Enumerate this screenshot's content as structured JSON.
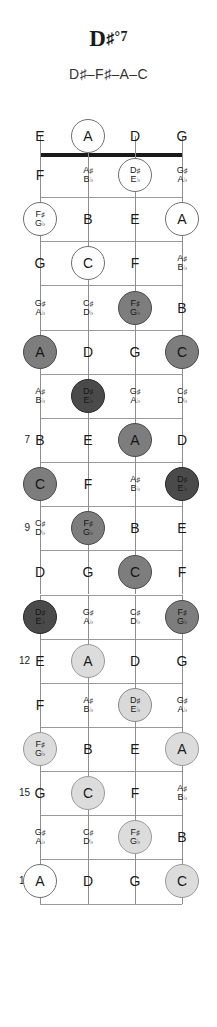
{
  "header": {
    "chord_name": "D#°7",
    "chord_root": "D",
    "chord_accidental": "♯",
    "chord_quality": "°7",
    "chord_notes": "D♯–F♯–A–C"
  },
  "diagram": {
    "type": "bass-fretboard",
    "instrument": "bass-guitar",
    "string_count": 4,
    "strings_open": [
      "E",
      "A",
      "D",
      "G"
    ],
    "fret_start": 0,
    "fret_end": 17,
    "marked_fret_numbers": [
      "5",
      "7",
      "9",
      "12",
      "15",
      "17"
    ],
    "chord_tones": [
      "D♯",
      "F♯",
      "A",
      "C"
    ],
    "root_tone": "D♯",
    "colors": {
      "root_fill": "#4a4a4a",
      "tone_fill": "#7d7d7d",
      "root_fill_octave": "#d9d9d9",
      "tone_fill_octave": "#dcdcdc",
      "open_fill": "#ffffff",
      "nut": "#1a1a1a",
      "fret": "#9a9a9a",
      "string": "#8e8e8e"
    },
    "rows": [
      {
        "fret": 0,
        "label": "",
        "notes": [
          {
            "t": "E"
          },
          {
            "t": "A",
            "s": "open"
          },
          {
            "t": "D"
          },
          {
            "t": "G"
          }
        ]
      },
      {
        "fret": 1,
        "label": "",
        "notes": [
          {
            "t": "F"
          },
          {
            "t": "A♯",
            "t2": "B♭"
          },
          {
            "t": "D♯",
            "t2": "E♭",
            "s": "open"
          },
          {
            "t": "G♯",
            "t2": "A♭"
          }
        ]
      },
      {
        "fret": 2,
        "label": "",
        "notes": [
          {
            "t": "F♯",
            "t2": "G♭",
            "s": "open"
          },
          {
            "t": "B"
          },
          {
            "t": "E"
          },
          {
            "t": "A",
            "s": "open"
          }
        ]
      },
      {
        "fret": 3,
        "label": "",
        "notes": [
          {
            "t": "G"
          },
          {
            "t": "C",
            "s": "open"
          },
          {
            "t": "F"
          },
          {
            "t": "A♯",
            "t2": "B♭"
          }
        ]
      },
      {
        "fret": 4,
        "label": "",
        "notes": [
          {
            "t": "G♯",
            "t2": "A♭"
          },
          {
            "t": "C♯",
            "t2": "D♭"
          },
          {
            "t": "F♯",
            "t2": "G♭",
            "s": "tone"
          },
          {
            "t": "B"
          }
        ]
      },
      {
        "fret": 5,
        "label": "5",
        "notes": [
          {
            "t": "A",
            "s": "tone"
          },
          {
            "t": "D"
          },
          {
            "t": "G"
          },
          {
            "t": "C",
            "s": "tone"
          }
        ]
      },
      {
        "fret": 6,
        "label": "",
        "notes": [
          {
            "t": "A♯",
            "t2": "B♭"
          },
          {
            "t": "D♯",
            "t2": "E♭",
            "s": "root"
          },
          {
            "t": "G♯",
            "t2": "A♭"
          },
          {
            "t": "C♯",
            "t2": "D♭"
          }
        ]
      },
      {
        "fret": 7,
        "label": "7",
        "notes": [
          {
            "t": "B"
          },
          {
            "t": "E"
          },
          {
            "t": "A",
            "s": "tone"
          },
          {
            "t": "D"
          }
        ]
      },
      {
        "fret": 8,
        "label": "",
        "notes": [
          {
            "t": "C",
            "s": "tone"
          },
          {
            "t": "F"
          },
          {
            "t": "A♯",
            "t2": "B♭"
          },
          {
            "t": "D♯",
            "t2": "E♭",
            "s": "root"
          }
        ]
      },
      {
        "fret": 9,
        "label": "9",
        "notes": [
          {
            "t": "C♯",
            "t2": "D♭"
          },
          {
            "t": "F♯",
            "t2": "G♭",
            "s": "tone"
          },
          {
            "t": "B"
          },
          {
            "t": "E"
          }
        ]
      },
      {
        "fret": 10,
        "label": "",
        "notes": [
          {
            "t": "D"
          },
          {
            "t": "G"
          },
          {
            "t": "C",
            "s": "tone"
          },
          {
            "t": "F"
          }
        ]
      },
      {
        "fret": 11,
        "label": "",
        "notes": [
          {
            "t": "D♯",
            "t2": "E♭",
            "s": "root"
          },
          {
            "t": "G♯",
            "t2": "A♭"
          },
          {
            "t": "C♯",
            "t2": "D♭"
          },
          {
            "t": "F♯",
            "t2": "G♭",
            "s": "tone"
          }
        ]
      },
      {
        "fret": 12,
        "label": "12",
        "notes": [
          {
            "t": "E"
          },
          {
            "t": "A",
            "s": "tone-hi"
          },
          {
            "t": "D"
          },
          {
            "t": "G"
          }
        ]
      },
      {
        "fret": 13,
        "label": "",
        "notes": [
          {
            "t": "F"
          },
          {
            "t": "A♯",
            "t2": "B♭"
          },
          {
            "t": "D♯",
            "t2": "E♭",
            "s": "root-hi"
          },
          {
            "t": "G♯",
            "t2": "A♭"
          }
        ]
      },
      {
        "fret": 14,
        "label": "",
        "notes": [
          {
            "t": "F♯",
            "t2": "G♭",
            "s": "tone-hi"
          },
          {
            "t": "B"
          },
          {
            "t": "E"
          },
          {
            "t": "A",
            "s": "tone-hi"
          }
        ]
      },
      {
        "fret": 15,
        "label": "15",
        "notes": [
          {
            "t": "G"
          },
          {
            "t": "C",
            "s": "tone-hi"
          },
          {
            "t": "F"
          },
          {
            "t": "A♯",
            "t2": "B♭"
          }
        ]
      },
      {
        "fret": 16,
        "label": "",
        "notes": [
          {
            "t": "G♯",
            "t2": "A♭"
          },
          {
            "t": "C♯",
            "t2": "D♭"
          },
          {
            "t": "F♯",
            "t2": "G♭",
            "s": "tone-hi"
          },
          {
            "t": "B"
          }
        ]
      },
      {
        "fret": 17,
        "label": "17",
        "notes": [
          {
            "t": "A",
            "s": "open"
          },
          {
            "t": "D"
          },
          {
            "t": "G"
          },
          {
            "t": "C",
            "s": "tone-hi"
          }
        ]
      }
    ]
  }
}
